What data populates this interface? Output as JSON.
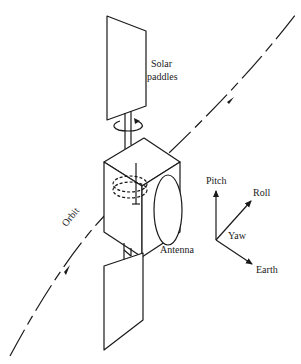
{
  "diagram": {
    "labels": {
      "solar_paddles_line1": "Solar",
      "solar_paddles_line2": "paddles",
      "orbit": "Orbit",
      "antenna": "Antenna",
      "pitch": "Pitch",
      "roll": "Roll",
      "yaw": "Yaw",
      "earth": "Earth"
    },
    "colors": {
      "ink": "#1a1a1a",
      "background": "#ffffff"
    }
  }
}
